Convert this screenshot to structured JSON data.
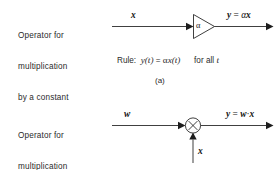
{
  "figure": {
    "caption_a": "(a)"
  },
  "block_a": {
    "description_line1": "Operator for",
    "description_line2": "multiplication",
    "description_line3": "by a constant",
    "input_label": "x",
    "operator_symbol": "α",
    "output_var": "y",
    "output_equals": "=",
    "output_expr_coefficient": "α",
    "output_expr_signal": "x",
    "rule_prefix": "Rule:",
    "rule_lhs": "y(t)",
    "rule_equals": "=",
    "rule_rhs_coefficient": "α",
    "rule_rhs_signal": "x(t)",
    "rule_qualifier_text": "for all",
    "rule_qualifier_var": "t"
  },
  "block_b": {
    "description_line1": "Operator for",
    "description_line2": "multiplication",
    "description_line3": "of two signals",
    "input_label_top": "w",
    "input_label_bottom": "x",
    "operator_symbol": "×",
    "output_var": "y",
    "output_equals": "=",
    "output_expr_first": "w",
    "output_expr_dot": "·",
    "output_expr_second": "x"
  },
  "colors": {
    "background": "#ffffff",
    "ink": "#1d1d1d",
    "text": "#2b2b2b"
  }
}
